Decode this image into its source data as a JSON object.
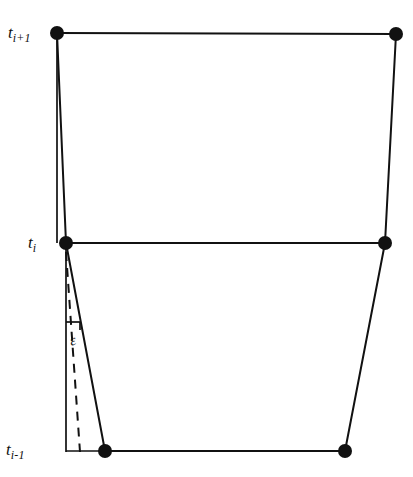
{
  "figure": {
    "title": "",
    "background_color": "#ffffff",
    "stroke_color": "#111111",
    "vertex_color": "#111111",
    "width": 413,
    "height": 477
  },
  "labels": {
    "t_next": {
      "base": "t",
      "sub": "i+1",
      "text": "t i+1"
    },
    "t_current": {
      "base": "t",
      "sub": "i",
      "text": "t i"
    },
    "t_prev": {
      "base": "t",
      "sub": "i-1",
      "text": "t i-1"
    },
    "angle": {
      "text": "ε",
      "name": "epsilon"
    }
  },
  "diagram_data": {
    "type": "mesh-layer-diagram",
    "description": "Two stacked quadrilateral mesh layers between time levels with a dashed reference vertical and an angle epsilon at the lower-left node.",
    "time_levels": [
      {
        "id": "t_next",
        "label": "t i+1",
        "y": 33
      },
      {
        "id": "t_current",
        "label": "t i",
        "y": 243
      },
      {
        "id": "t_prev",
        "label": "t i-1",
        "y": 451
      }
    ],
    "vertices": [
      {
        "id": "top-left",
        "x": 57,
        "y": 33,
        "level": "t_next"
      },
      {
        "id": "top-right",
        "x": 396,
        "y": 34,
        "level": "t_next"
      },
      {
        "id": "mid-left",
        "x": 66,
        "y": 243,
        "level": "t_current"
      },
      {
        "id": "mid-right",
        "x": 385,
        "y": 243,
        "level": "t_current"
      },
      {
        "id": "bottom-left",
        "x": 105,
        "y": 451,
        "level": "t_prev"
      },
      {
        "id": "bottom-right",
        "x": 345,
        "y": 451,
        "level": "t_prev"
      }
    ],
    "solid_edges": [
      {
        "from": "top-left",
        "to": "top-right"
      },
      {
        "from": "top-left",
        "to": "mid-left"
      },
      {
        "from": "top-right",
        "to": "mid-right"
      },
      {
        "from": "mid-left",
        "to": "mid-right"
      },
      {
        "from": "mid-left",
        "to": "bottom-left"
      },
      {
        "from": "mid-right",
        "to": "bottom-right"
      },
      {
        "from": "bottom-left",
        "to": "bottom-right"
      }
    ],
    "reference_verticals": [
      {
        "id": "upper-vertical",
        "x1": 57,
        "y1": 33,
        "x2": 57,
        "y2": 243,
        "style": "solid"
      },
      {
        "id": "lower-vertical",
        "x1": 66,
        "y1": 243,
        "x2": 66,
        "y2": 451,
        "style": "solid"
      }
    ],
    "dashed_segments": [
      {
        "id": "epsilon-dashed-ray",
        "x1": 66,
        "y1": 255,
        "x2": 79,
        "y2": 451,
        "style": "dashed"
      }
    ],
    "angle_marker": {
      "id": "epsilon-angle",
      "label": "ε",
      "tick_x": 72,
      "tick_y": 322,
      "between": [
        "lower-vertical",
        "epsilon-dashed-ray"
      ]
    },
    "vertex_radius": 6.5,
    "line_width": 2.0
  }
}
